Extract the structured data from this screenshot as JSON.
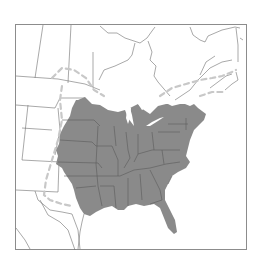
{
  "map": {
    "type": "species-range-map",
    "region": "Eastern North America",
    "colors": {
      "background": "#ffffff",
      "frame": "#8c8c8c",
      "boundaries": "#6e6e6e",
      "range_fill": "#8a8a8a",
      "range_state_lines": "#5a5a5a",
      "dashed_limit": "#c8c8c8",
      "water": "#ffffff"
    },
    "layers": [
      {
        "name": "frame",
        "description": "rectangular map border"
      },
      {
        "name": "political-boundaries",
        "description": "US state and Canadian province outlines"
      },
      {
        "name": "shaded-range",
        "description": "gray-filled range covering eastern and central United States"
      },
      {
        "name": "dashed-range-limit",
        "description": "light gray dashed line marking outer/northern range limit"
      }
    ]
  }
}
